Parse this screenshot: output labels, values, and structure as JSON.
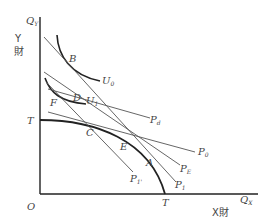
{
  "axes": {
    "y_axis_label": "Q",
    "y_axis_sub": "Y",
    "y_good_line1": "Y",
    "y_good_line2": "財",
    "x_axis_label": "Q",
    "x_axis_sub": "X",
    "x_good": "X財",
    "origin": "O"
  },
  "curves": {
    "ppf_label_y": "T",
    "ppf_label_x": "T",
    "u0_label": "U",
    "u0_sub": "0",
    "u1_label": "U",
    "u1_sub": "1"
  },
  "points": {
    "B": "B",
    "D": "D",
    "F": "F",
    "C": "C",
    "E": "E",
    "A": "A"
  },
  "price_lines": {
    "pd": {
      "label": "P",
      "sub": "d"
    },
    "p0": {
      "label": "P",
      "sub": "0"
    },
    "pe": {
      "label": "P",
      "sub": "E"
    },
    "p1": {
      "label": "P",
      "sub": "1"
    },
    "p1prime": {
      "label": "P",
      "sub": "1'"
    }
  },
  "colors": {
    "line": "#222222",
    "thin_line": "#555555",
    "text": "#444444"
  }
}
